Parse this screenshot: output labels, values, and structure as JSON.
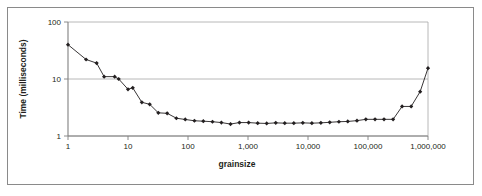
{
  "figure": {
    "background": "#ffffff",
    "border_color": "#8a8a8a",
    "plot": {
      "left_px": 68,
      "right_px": 428,
      "top_px": 22,
      "bottom_px": 136,
      "axis_color": "#808080",
      "grid_color": "#a6a6a6",
      "series_color": "#231f20"
    }
  },
  "chart_data": {
    "type": "line",
    "title": "",
    "subtitle": "",
    "xlabel": "grainsize",
    "ylabel": "Time (milliseconds)",
    "xscale": "log",
    "yscale": "log",
    "xlim": [
      1,
      1000000
    ],
    "ylim": [
      1,
      100
    ],
    "xticks": [
      1,
      10,
      100,
      1000,
      10000,
      100000,
      1000000
    ],
    "xtick_labels": [
      "1",
      "10",
      "100",
      "1,000",
      "10,000",
      "100,000",
      "1,000,000"
    ],
    "yticks": [
      1,
      10,
      100
    ],
    "ytick_labels": [
      "1",
      "10",
      "100"
    ],
    "grid": "horizontal",
    "legend": "none",
    "marker": "filled-diamond",
    "series": [
      {
        "name": "time vs grainsize",
        "x": [
          1,
          2,
          3,
          4,
          6,
          7,
          10,
          12,
          17,
          23,
          32,
          45,
          64,
          90,
          128,
          180,
          256,
          360,
          512,
          720,
          1024,
          1450,
          2048,
          2900,
          4096,
          5800,
          8192,
          11600,
          16384,
          23000,
          32768,
          46000,
          65536,
          92000,
          131072,
          185000,
          262144,
          370000,
          524288,
          740000,
          1000000
        ],
        "y": [
          40,
          22,
          19,
          11,
          11,
          10,
          6.6,
          7.0,
          3.9,
          3.6,
          2.55,
          2.5,
          2.05,
          1.95,
          1.85,
          1.82,
          1.78,
          1.72,
          1.62,
          1.72,
          1.72,
          1.68,
          1.66,
          1.7,
          1.68,
          1.68,
          1.7,
          1.68,
          1.7,
          1.74,
          1.78,
          1.8,
          1.86,
          1.96,
          1.96,
          1.96,
          1.96,
          3.3,
          3.3,
          6.0,
          15.5
        ]
      }
    ]
  }
}
